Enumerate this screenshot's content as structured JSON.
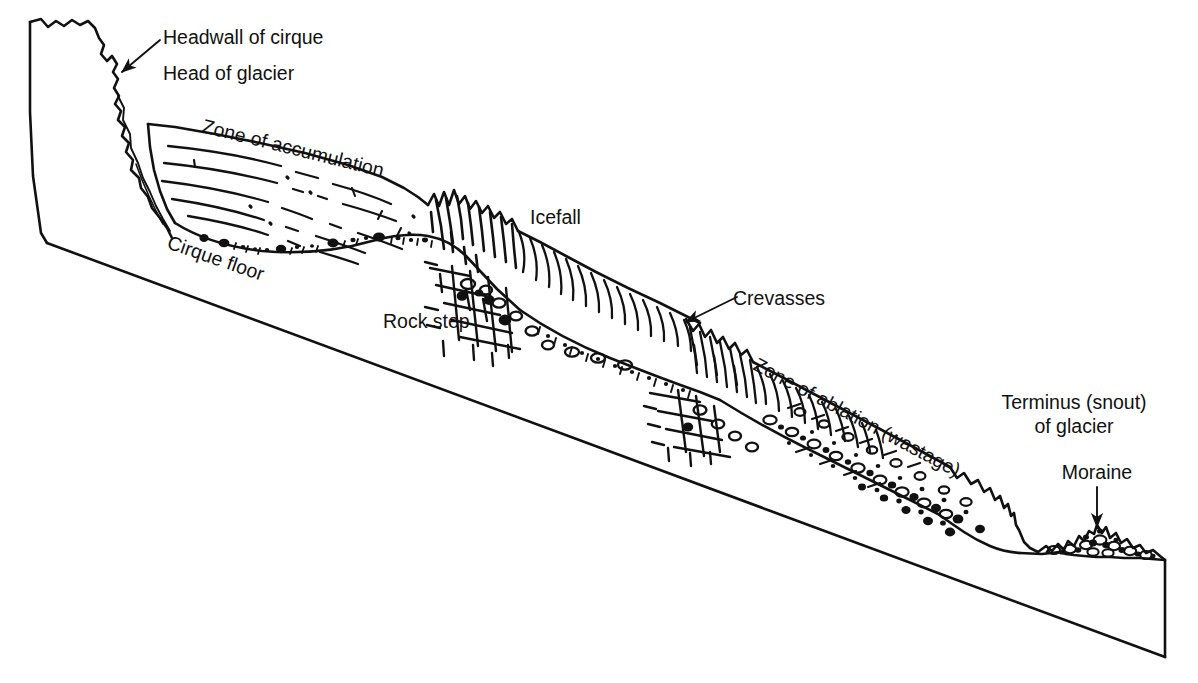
{
  "figure": {
    "type": "geologic-block-diagram",
    "style": "black-and-white line drawing",
    "background_color": "#ffffff",
    "line_color": "#111111"
  },
  "labels": {
    "headwall_of_cirque": "Headwall of cirque",
    "head_of_glacier": "Head of glacier",
    "zone_of_accumulation": "Zone of accumulation",
    "cirque_floor": "Cirque floor",
    "icefall": "Icefall",
    "rock_step": "Rock step",
    "crevasses": "Crevasses",
    "zone_of_ablation": "Zone of ablation (wastage)",
    "terminus_line1": "Terminus (snout)",
    "terminus_line2": "of glacier",
    "moraine": "Moraine"
  },
  "annotations": [
    {
      "name": "headwall-leader",
      "label": "Headwall of cirque",
      "kind": "arrow",
      "from": [
        160,
        40
      ],
      "to": [
        120,
        73
      ]
    },
    {
      "name": "crevasses-leader",
      "label": "Crevasses",
      "kind": "arrow",
      "from": [
        737,
        297
      ],
      "to": [
        684,
        323
      ]
    },
    {
      "name": "moraine-leader",
      "label": "Moraine",
      "kind": "arrow",
      "from": [
        1097,
        487
      ],
      "to": [
        1097,
        528
      ]
    }
  ],
  "label_placement": [
    {
      "name": "headwall-of-cirque-label",
      "text": "Headwall of cirque",
      "x": 163,
      "y": 44,
      "rotation": 0
    },
    {
      "name": "head-of-glacier-label",
      "text": "Head of glacier",
      "x": 163,
      "y": 80,
      "rotation": 0
    },
    {
      "name": "zone-of-accumulation-label",
      "text": "Zone of accumulation",
      "x": 201,
      "y": 132,
      "rotation": 14
    },
    {
      "name": "cirque-floor-label",
      "text": "Cirque floor",
      "x": 166,
      "y": 248,
      "rotation": 19
    },
    {
      "name": "icefall-label",
      "text": "Icefall",
      "x": 530,
      "y": 224,
      "rotation": 0
    },
    {
      "name": "rock-step-label",
      "text": "Rock step",
      "x": 383,
      "y": 328,
      "rotation": 0
    },
    {
      "name": "crevasses-label",
      "text": "Crevasses",
      "x": 733,
      "y": 305,
      "rotation": 0
    },
    {
      "name": "zone-of-ablation-label",
      "text": "Zone of ablation (wastage)",
      "x": 752,
      "y": 369,
      "rotation": 28
    },
    {
      "name": "terminus-label-line1",
      "text": "Terminus (snout)",
      "x": 1074,
      "y": 409,
      "rotation": 0
    },
    {
      "name": "terminus-label-line2",
      "text": "of glacier",
      "x": 1074,
      "y": 433,
      "rotation": 0
    },
    {
      "name": "moraine-label",
      "text": "Moraine",
      "x": 1097,
      "y": 479,
      "rotation": 0
    }
  ]
}
